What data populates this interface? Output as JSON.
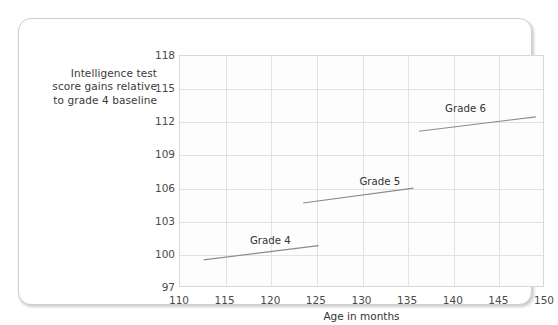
{
  "chart_data": {
    "type": "line",
    "title": "",
    "xlabel": "Age in months",
    "ylabel": "Intelligence test score gains relative to grade 4 baseline",
    "ylabel_lines": [
      "Intelligence test",
      "score gains relative",
      "to grade 4 baseline"
    ],
    "xlim": [
      110,
      150
    ],
    "ylim": [
      97,
      118
    ],
    "xticks": [
      110,
      115,
      120,
      125,
      130,
      135,
      140,
      145,
      150
    ],
    "yticks": [
      97,
      100,
      103,
      106,
      109,
      112,
      115,
      118
    ],
    "grid": true,
    "legend_position": "inline-labels",
    "line_color": "#8a8a8a",
    "grid_color": "#e2e2e2",
    "series": [
      {
        "name": "Grade 4",
        "label": "Grade 4",
        "label_x": 120.0,
        "label_y": 101.3,
        "points": [
          {
            "x": 112.7,
            "y": 99.45
          },
          {
            "x": 125.3,
            "y": 100.75
          }
        ]
      },
      {
        "name": "Grade 5",
        "label": "Grade 5",
        "label_x": 132.0,
        "label_y": 106.6,
        "points": [
          {
            "x": 123.6,
            "y": 104.6
          },
          {
            "x": 135.7,
            "y": 105.95
          }
        ]
      },
      {
        "name": "Grade 6",
        "label": "Grade 6",
        "label_x": 141.4,
        "label_y": 113.2,
        "points": [
          {
            "x": 136.3,
            "y": 111.1
          },
          {
            "x": 149.1,
            "y": 112.4
          }
        ]
      }
    ]
  }
}
